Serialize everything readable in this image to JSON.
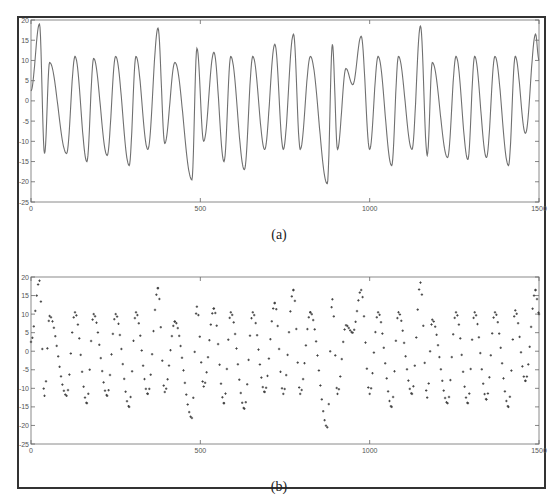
{
  "figure": {
    "captions": [
      "(a)",
      "(b)"
    ]
  },
  "chart_data": [
    {
      "type": "line",
      "panel": "(a)",
      "title": "",
      "xlabel": "",
      "ylabel": "",
      "xlim": [
        0,
        1500
      ],
      "ylim": [
        -25,
        20
      ],
      "xticks": [
        0,
        500,
        1000,
        1500
      ],
      "yticks": [
        20,
        15,
        10,
        5,
        0,
        -5,
        -10,
        -15,
        -20,
        -25
      ],
      "grid": false,
      "style": "solid line",
      "color": "#777777",
      "extrema": {
        "x": [
          0,
          25,
          40,
          55,
          105,
          130,
          165,
          185,
          225,
          250,
          290,
          310,
          345,
          375,
          395,
          425,
          475,
          490,
          510,
          540,
          570,
          590,
          630,
          655,
          690,
          720,
          745,
          775,
          795,
          825,
          875,
          890,
          905,
          930,
          950,
          975,
          1000,
          1025,
          1065,
          1085,
          1125,
          1150,
          1170,
          1185,
          1230,
          1255,
          1290,
          1310,
          1345,
          1370,
          1410,
          1430,
          1460,
          1490,
          1500
        ],
        "y": [
          2.5,
          19,
          -13,
          9.5,
          -13,
          11,
          -15,
          10.5,
          -13.5,
          11,
          -16,
          11,
          -12,
          18,
          -10.5,
          9.5,
          -19.5,
          13,
          -10,
          12,
          -15,
          11,
          -17,
          11,
          -12,
          14,
          -12,
          16.5,
          -12,
          11,
          -20.5,
          14,
          -12,
          8,
          4,
          16,
          -12,
          11,
          -16,
          11,
          -12,
          18.5,
          -13.5,
          9.5,
          -14,
          11,
          -14.5,
          11,
          -14,
          11,
          -16,
          11,
          -8,
          16.5,
          10
        ]
      }
    },
    {
      "type": "scatter",
      "panel": "(b)",
      "title": "",
      "xlabel": "",
      "ylabel": "",
      "xlim": [
        0,
        1500
      ],
      "ylim": [
        -25,
        20
      ],
      "xticks": [
        0,
        500,
        1000,
        1500
      ],
      "yticks": [
        20,
        15,
        10,
        5,
        0,
        -5,
        -10,
        -15,
        -20,
        -25
      ],
      "grid": false,
      "style": "dotted markers (+)",
      "color": "#444444",
      "extrema": {
        "x": [
          0,
          25,
          40,
          55,
          105,
          130,
          165,
          185,
          225,
          250,
          290,
          310,
          345,
          375,
          395,
          425,
          475,
          490,
          510,
          540,
          570,
          590,
          630,
          655,
          690,
          720,
          745,
          775,
          795,
          825,
          875,
          890,
          905,
          930,
          950,
          975,
          1000,
          1025,
          1065,
          1085,
          1125,
          1150,
          1170,
          1185,
          1230,
          1255,
          1290,
          1310,
          1345,
          1370,
          1410,
          1430,
          1460,
          1490,
          1500
        ],
        "y": [
          2.5,
          19,
          -12,
          9.5,
          -12,
          10.5,
          -14,
          10,
          -12,
          10,
          -15,
          10.5,
          -11.5,
          17,
          -11,
          8,
          -18,
          12,
          -9.5,
          11.5,
          -14,
          10.5,
          -15.5,
          10.5,
          -11,
          13,
          -11.5,
          16.5,
          -11.5,
          10.5,
          -20.5,
          14,
          -11.5,
          7,
          5,
          16.5,
          -11.5,
          10.5,
          -15,
          10.5,
          -11.5,
          18.5,
          -12.5,
          8.5,
          -14,
          10.5,
          -14,
          10.5,
          -13,
          10.5,
          -15,
          11,
          -8,
          16.5,
          10
        ]
      }
    }
  ],
  "colors": {
    "frame": "#333333",
    "axes": "#8a8a8a",
    "line_a": "#707070",
    "markers_b": "#3f3f3f"
  }
}
